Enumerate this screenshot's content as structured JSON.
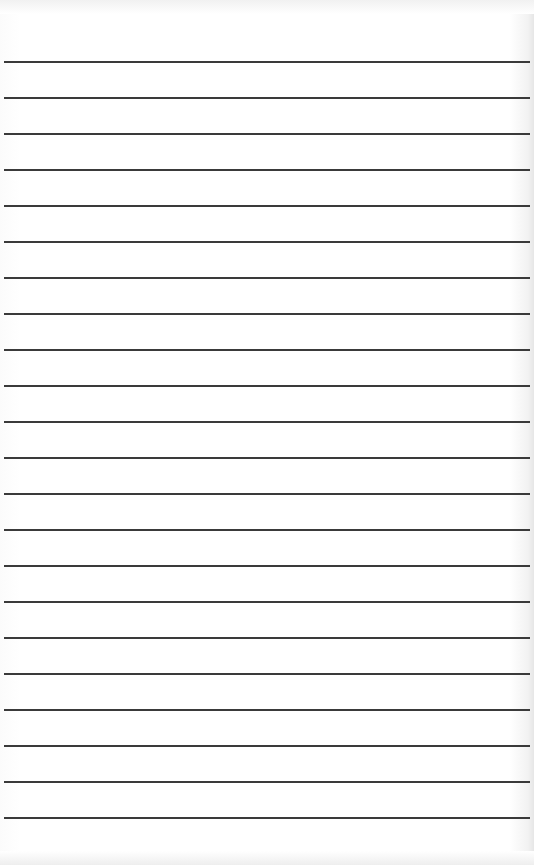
{
  "image": {
    "subject": "lined paper",
    "line_count": 22,
    "first_line_y": 61,
    "line_spacing_px": 36,
    "line_color": "#3a3a3a",
    "background_color": "#ffffff"
  }
}
